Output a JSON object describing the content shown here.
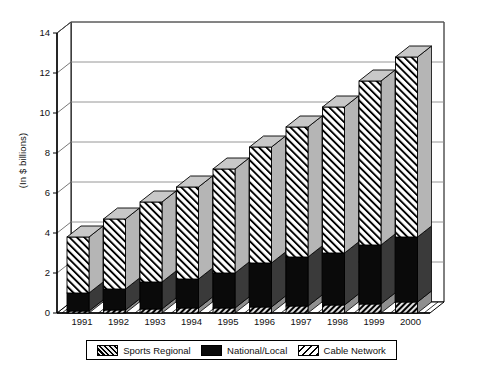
{
  "chart_data": {
    "type": "bar",
    "subtype": "stacked-3d-column",
    "title": "",
    "subtitle": "",
    "xlabel": "",
    "ylabel": "(In $ billions)",
    "categories": [
      "1991",
      "1992",
      "1993",
      "1994",
      "1995",
      "1996",
      "1997",
      "1998",
      "1999",
      "2000"
    ],
    "series": [
      {
        "name": "Sports Regional",
        "pattern": "dark-dense-hatch",
        "values": [
          0.1,
          0.15,
          0.2,
          0.25,
          0.25,
          0.3,
          0.35,
          0.4,
          0.45,
          0.55
        ]
      },
      {
        "name": "National/Local",
        "pattern": "solid-black",
        "values": [
          0.9,
          1.05,
          1.35,
          1.45,
          1.75,
          2.2,
          2.45,
          2.6,
          2.95,
          3.25
        ]
      },
      {
        "name": "Cable Network",
        "pattern": "light-diagonal-hatch",
        "values": [
          2.8,
          3.5,
          4.0,
          4.6,
          5.2,
          5.8,
          6.5,
          7.3,
          8.2,
          9.0
        ]
      }
    ],
    "totals": [
      3.8,
      4.7,
      5.55,
      6.3,
      7.2,
      8.3,
      9.3,
      10.3,
      11.6,
      12.8
    ],
    "ylim": [
      0,
      14
    ],
    "yticks": [
      0,
      2,
      4,
      6,
      8,
      10,
      12,
      14
    ],
    "ytick_labels": [
      "0",
      "2",
      "4",
      "6",
      "8",
      "10",
      "12",
      "14"
    ],
    "grid": "horizontal",
    "legend_position": "bottom",
    "legend_entries": [
      "Sports Regional",
      "National/Local",
      "Cable Network"
    ],
    "colors": {
      "sports_regional": "#6d6d6d",
      "national_local": "#0a0a0a",
      "cable_network": "#ffffff",
      "axis": "#000000",
      "gridline": "#8a8a8a",
      "bar_side": "#b0b0b0",
      "bar_top": "#c8c8c8"
    }
  }
}
